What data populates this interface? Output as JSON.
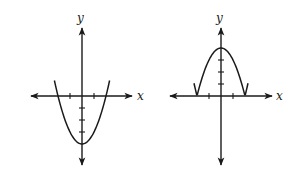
{
  "figure": {
    "graphs": [
      {
        "id": "left",
        "x_label": "x",
        "y_label": "y",
        "origin_px": [
          82,
          96
        ],
        "unit_px": 12,
        "x_axis_px": [
          31,
          132
        ],
        "y_axis_px": [
          28,
          165
        ],
        "x_ticks": [
          -1,
          1
        ],
        "y_ticks": [
          -1,
          -2,
          -3
        ],
        "curve": {
          "equation": "y = x^2 - 4",
          "x_range": [
            -2.3,
            2.3
          ],
          "vertex": [
            0,
            -4
          ],
          "roots": [
            -2,
            2
          ]
        }
      },
      {
        "id": "right",
        "x_label": "x",
        "y_label": "y",
        "origin_px": [
          221,
          96
        ],
        "unit_px": 12,
        "x_axis_px": [
          170,
          272
        ],
        "y_axis_px": [
          28,
          165
        ],
        "x_ticks": [
          -1,
          1
        ],
        "y_ticks": [
          1,
          2,
          3
        ],
        "curve": {
          "equation": "y = |4 - x^2| (partial)",
          "x_range": [
            -2.25,
            2.25
          ],
          "vertex": [
            0,
            4
          ],
          "roots": [
            -2,
            2
          ]
        }
      }
    ]
  },
  "chart_data": [
    {
      "type": "line",
      "title": "",
      "xlabel": "x",
      "ylabel": "y",
      "equation": "y = x^2 - 4",
      "x": [
        -2.3,
        -2,
        -1.5,
        -1,
        -0.5,
        0,
        0.5,
        1,
        1.5,
        2,
        2.3
      ],
      "y": [
        1.29,
        0,
        -1.75,
        -3,
        -3.75,
        -4,
        -3.75,
        -3,
        -1.75,
        0,
        1.29
      ],
      "x_ticks": [
        -1,
        1
      ],
      "y_ticks": [
        -1,
        -2,
        -3
      ],
      "grid": false
    },
    {
      "type": "line",
      "title": "",
      "xlabel": "x",
      "ylabel": "y",
      "equation": "y = |4 - x^2| (shown for -2.25 <= x <= 2.25)",
      "x": [
        -2.25,
        -2,
        -1.5,
        -1,
        -0.5,
        0,
        0.5,
        1,
        1.5,
        2,
        2.25
      ],
      "y": [
        1.06,
        0,
        1.75,
        3,
        3.75,
        4,
        3.75,
        3,
        1.75,
        0,
        1.06
      ],
      "x_ticks": [
        -1,
        1
      ],
      "y_ticks": [
        1,
        2,
        3
      ],
      "grid": false
    }
  ]
}
